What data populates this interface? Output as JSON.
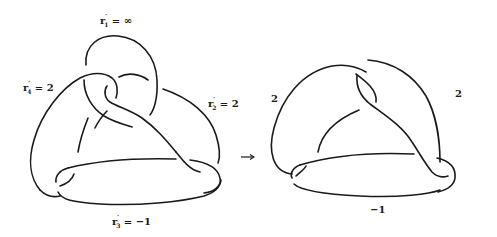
{
  "figure": {
    "left_diagram": {
      "labels": [
        {
          "id": "r1",
          "base": "r",
          "prime": "′",
          "index": "1",
          "eq": " = ",
          "value": "∞"
        },
        {
          "id": "r4",
          "base": "r",
          "prime": "′",
          "index": "4",
          "eq": " = ",
          "value": "2"
        },
        {
          "id": "r2",
          "base": "r",
          "prime": "′",
          "index": "2",
          "eq": " = ",
          "value": "2"
        },
        {
          "id": "r3",
          "base": "r",
          "prime": "′",
          "index": "3",
          "eq": " = ",
          "value": "−1"
        }
      ]
    },
    "arrow": {
      "symbol": "→"
    },
    "right_diagram": {
      "labels": [
        {
          "id": "left",
          "value": "2"
        },
        {
          "id": "right",
          "value": "2"
        },
        {
          "id": "bottom",
          "value": "−1"
        }
      ]
    }
  }
}
